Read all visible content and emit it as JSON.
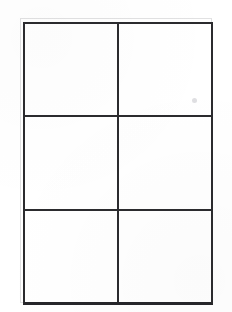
{
  "document": {
    "kind": "scanned-blank-grid-worksheet",
    "title": "",
    "background_color": "#ffffff",
    "canvas": {
      "width": 232,
      "height": 312
    }
  },
  "grid": {
    "columns": 2,
    "rows": 3,
    "cell_count": 6,
    "line_color": "#2b2b2e",
    "line_width_px": 2,
    "bounds": {
      "left": 23,
      "top": 22,
      "width": 190,
      "height": 283
    },
    "column_divider_x": [
      119
    ],
    "row_divider_y": [
      117,
      211
    ],
    "cells": [
      {
        "row": 0,
        "col": 0,
        "text": ""
      },
      {
        "row": 0,
        "col": 1,
        "text": ""
      },
      {
        "row": 1,
        "col": 0,
        "text": ""
      },
      {
        "row": 1,
        "col": 1,
        "text": ""
      },
      {
        "row": 2,
        "col": 0,
        "text": ""
      },
      {
        "row": 2,
        "col": 1,
        "text": ""
      }
    ]
  },
  "artifacts": {
    "ghost_frame_color": "#787881",
    "speck_color": "#96969e"
  }
}
